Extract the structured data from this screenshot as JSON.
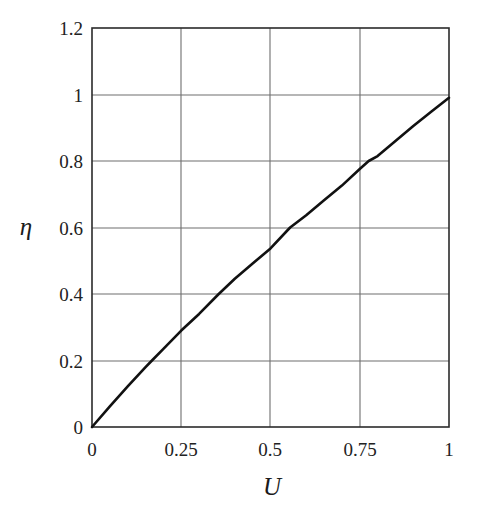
{
  "figure": {
    "background_color": "#ffffff",
    "frame_color": "#2b2b2b",
    "grid_color": "#6e6e6e",
    "curve_color": "#111111"
  },
  "chart_data": {
    "type": "line",
    "title": "",
    "subtitle": "",
    "xlabel": "U",
    "ylabel": "η",
    "xlim": [
      0,
      1
    ],
    "ylim": [
      0,
      1.2
    ],
    "grid": true,
    "legend": null,
    "legend_position": "none",
    "xticks": [
      0,
      0.25,
      0.5,
      0.75,
      1
    ],
    "xtick_labels": [
      "0",
      "0.25",
      "0.5",
      "0.75",
      "1"
    ],
    "yticks": [
      0,
      0.2,
      0.4,
      0.6,
      0.8,
      1,
      1.2
    ],
    "ytick_labels": [
      "0",
      "0.2",
      "0.4",
      "0.6",
      "0.8",
      "1",
      "1.2"
    ],
    "series": [
      {
        "name": "eta(U)",
        "color": "#111111",
        "line_width": 2.6,
        "x": [
          0.0,
          0.05,
          0.1,
          0.15,
          0.168,
          0.2,
          0.25,
          0.3,
          0.355,
          0.4,
          0.45,
          0.5,
          0.555,
          0.6,
          0.65,
          0.7,
          0.75,
          0.775,
          0.8,
          0.85,
          0.9,
          0.95,
          1.0
        ],
        "y": [
          0.0,
          0.062,
          0.122,
          0.18,
          0.2,
          0.235,
          0.29,
          0.34,
          0.4,
          0.446,
          0.492,
          0.537,
          0.6,
          0.637,
          0.682,
          0.726,
          0.776,
          0.8,
          0.815,
          0.86,
          0.905,
          0.948,
          0.99
        ]
      }
    ],
    "annotations": []
  },
  "axes": {
    "y_axis_title": "η",
    "x_axis_title": "U"
  }
}
